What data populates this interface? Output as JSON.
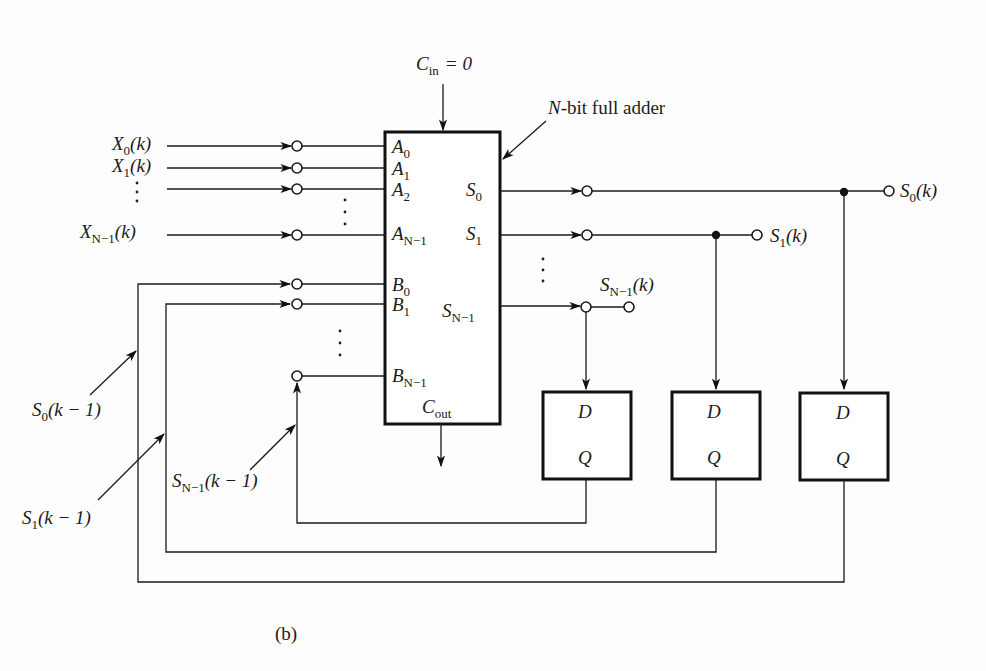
{
  "figure": {
    "caption": "(b)",
    "title_annotation": "N-bit full adder",
    "title_annotation_parts": {
      "italic": "N",
      "rest": "-bit full adder"
    }
  },
  "adder": {
    "carry_in": {
      "symbol": "C",
      "subscript": "in",
      "value": "= 0"
    },
    "carry_out": {
      "symbol": "C",
      "subscript": "out"
    },
    "a_ports": [
      {
        "symbol": "A",
        "subscript": "0"
      },
      {
        "symbol": "A",
        "subscript": "1"
      },
      {
        "symbol": "A",
        "subscript": "2"
      },
      {
        "symbol": "A",
        "subscript": "N−1"
      }
    ],
    "b_ports": [
      {
        "symbol": "B",
        "subscript": "0"
      },
      {
        "symbol": "B",
        "subscript": "1"
      },
      {
        "symbol": "B",
        "subscript": "N−1"
      }
    ],
    "s_ports": [
      {
        "symbol": "S",
        "subscript": "0"
      },
      {
        "symbol": "S",
        "subscript": "1"
      },
      {
        "symbol": "S",
        "subscript": "N−1"
      }
    ]
  },
  "inputs": [
    {
      "symbol": "X",
      "subscript": "0",
      "arg": "(k)"
    },
    {
      "symbol": "X",
      "subscript": "1",
      "arg": "(k)"
    },
    {
      "symbol": "X",
      "subscript": "N−1",
      "arg": "(k)"
    }
  ],
  "outputs": [
    {
      "symbol": "S",
      "subscript": "0",
      "arg": "(k)"
    },
    {
      "symbol": "S",
      "subscript": "1",
      "arg": "(k)"
    },
    {
      "symbol": "S",
      "subscript": "N−1",
      "arg": "(k)"
    }
  ],
  "feedback": [
    {
      "symbol": "S",
      "subscript": "0",
      "arg": "(k − 1)"
    },
    {
      "symbol": "S",
      "subscript": "1",
      "arg": "(k − 1)"
    },
    {
      "symbol": "S",
      "subscript": "N−1",
      "arg": "(k − 1)"
    }
  ],
  "flip_flops": [
    {
      "input": "D",
      "output": "Q"
    },
    {
      "input": "D",
      "output": "Q"
    },
    {
      "input": "D",
      "output": "Q"
    }
  ],
  "colors": {
    "ink": "#1a1a1a",
    "paper": "#fdfdfd"
  }
}
